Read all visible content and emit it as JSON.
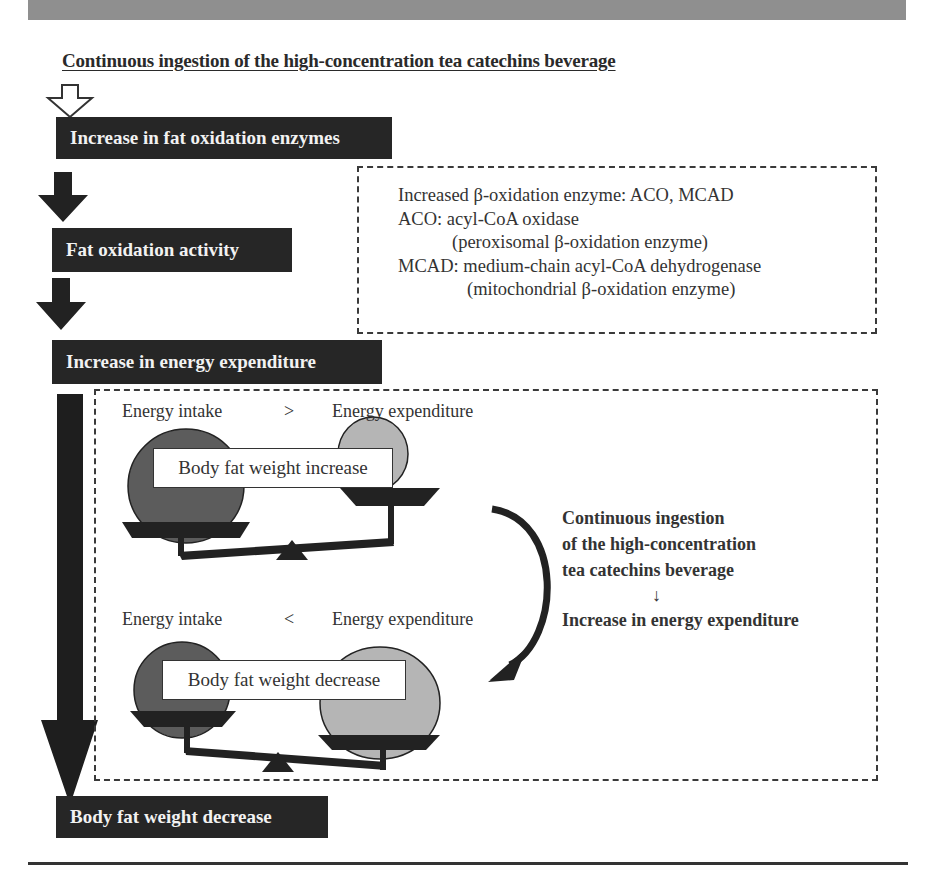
{
  "header": {
    "title": "Continuous ingestion of the high-concentration tea catechins beverage"
  },
  "flow": {
    "steps": [
      {
        "label": "Increase in fat oxidation enzymes"
      },
      {
        "label": "Fat oxidation activity"
      },
      {
        "label": "Increase in energy expenditure"
      },
      {
        "label": "Body fat weight decrease"
      }
    ]
  },
  "enzyme_note": {
    "lines": [
      "Increased β-oxidation enzyme: ACO, MCAD",
      "ACO: acyl-CoA oxidase",
      "(peroxisomal β-oxidation enzyme)",
      "MCAD: medium-chain acyl-CoA dehydrogenase",
      "(mitochondrial β-oxidation enzyme)"
    ]
  },
  "balance_top": {
    "left_label": "Energy intake",
    "operator": ">",
    "right_label": "Energy expenditure",
    "result": "Body fat weight increase"
  },
  "balance_bottom": {
    "left_label": "Energy intake",
    "operator": "<",
    "right_label": "Energy expenditure",
    "result": "Body fat weight decrease"
  },
  "side_note": {
    "lines": [
      "Continuous ingestion",
      "of the high-concentration",
      "tea catechins beverage"
    ],
    "arrow": "↓",
    "result": "Increase in energy expenditure"
  },
  "colors": {
    "box_fill": "#262626",
    "intake_ball": "#5c5c5c",
    "expenditure_ball": "#b5b5b5",
    "band": "#8f8f8f"
  }
}
